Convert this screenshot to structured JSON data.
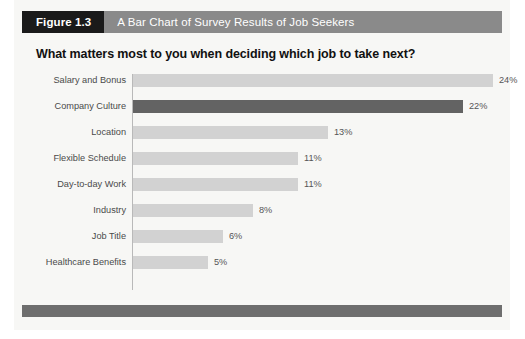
{
  "figure": {
    "tag": "Figure 1.3",
    "caption": "A Bar Chart of Survey Results of Job Seekers"
  },
  "colors": {
    "tag_background": "#1a1a1a",
    "caption_background": "#8a8a8a",
    "bar_default": "#d2d2d2",
    "bar_highlight": "#636363",
    "footer": "#6e6e6e",
    "page_background": "#f7f7f5"
  },
  "chart_data": {
    "type": "bar",
    "orientation": "horizontal",
    "title": "What matters most to you when deciding which job to take next?",
    "xlabel": "",
    "ylabel": "",
    "grid": false,
    "legend": null,
    "xlim": [
      0,
      26
    ],
    "categories": [
      "Salary and Bonus",
      "Company Culture",
      "Location",
      "Flexible Schedule",
      "Day-to-day Work",
      "Industry",
      "Job Title",
      "Healthcare Benefits"
    ],
    "values": [
      24,
      22,
      13,
      11,
      11,
      8,
      6,
      5
    ],
    "data_labels": [
      "24%",
      "22%",
      "13%",
      "11%",
      "11%",
      "8%",
      "6%",
      "5%"
    ],
    "highlighted_index": 1
  }
}
